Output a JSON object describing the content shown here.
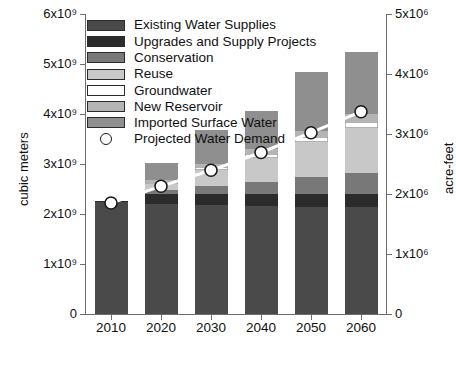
{
  "chart_data": {
    "type": "bar",
    "subtype": "stacked-bar-with-line",
    "title": "",
    "xlabel": "",
    "ylabel": "cubic meters",
    "y2label": "acre-feet",
    "categories": [
      "2010",
      "2020",
      "2030",
      "2040",
      "2050",
      "2060"
    ],
    "ylim": [
      0,
      6000000000
    ],
    "y2lim": [
      0,
      5000000
    ],
    "yticks": [
      "0",
      "1x10⁹",
      "2x10⁹",
      "3x10⁹",
      "4x10⁹",
      "5x10⁹",
      "6x10⁹"
    ],
    "ytick_values": [
      0,
      1000000000,
      2000000000,
      3000000000,
      4000000000,
      5000000000,
      6000000000
    ],
    "y2ticks": [
      "0",
      "1x10⁶",
      "2x10⁶",
      "3x10⁶",
      "4x10⁶",
      "5x10⁶"
    ],
    "y2tick_values": [
      0,
      1000000,
      2000000,
      3000000,
      4000000,
      5000000
    ],
    "grid": false,
    "legend_position": "upper-left",
    "series": [
      {
        "name": "Existing Water Supplies",
        "color": "#4a4a4a",
        "values": [
          2250000000,
          2200000000,
          2180000000,
          2160000000,
          2150000000,
          2140000000
        ]
      },
      {
        "name": "Upgrades and Supply Projects",
        "color": "#2b2b2b",
        "values": [
          20000000,
          200000000,
          230000000,
          250000000,
          260000000,
          270000000
        ]
      },
      {
        "name": "Conservation",
        "color": "#787878",
        "values": [
          0,
          80000000,
          160000000,
          240000000,
          330000000,
          420000000
        ]
      },
      {
        "name": "Reuse",
        "color": "#c8c8c8",
        "values": [
          0,
          130000000,
          310000000,
          470000000,
          700000000,
          900000000
        ]
      },
      {
        "name": "Groundwater",
        "color": "#fdfdfd",
        "values": [
          0,
          40000000,
          70000000,
          90000000,
          110000000,
          120000000
        ]
      },
      {
        "name": "New Reservoir",
        "color": "#b4b4b4",
        "values": [
          0,
          30000000,
          60000000,
          90000000,
          120000000,
          150000000
        ]
      },
      {
        "name": "Imported Surface Water",
        "color": "#8f8f8f",
        "values": [
          0,
          350000000,
          680000000,
          760000000,
          1180000000,
          1250000000
        ]
      }
    ],
    "line_series": {
      "name": "Projected Water Demand",
      "marker": "circle",
      "marker_face_color": "#ffffff",
      "marker_edge_color": "#1a1a1a",
      "line_color": "#ffffff",
      "unit": "acre-feet",
      "values_acre_feet": [
        1800000,
        2070000,
        2330000,
        2620000,
        2940000,
        3280000
      ],
      "values_cubic_meters": [
        2220000000,
        2553000000,
        2874000000,
        3231000000,
        3626000000,
        4045000000
      ]
    }
  },
  "legend": {
    "items": [
      {
        "label": "Existing Water Supplies",
        "swatch": "#4a4a4a",
        "type": "box"
      },
      {
        "label": "Upgrades and Supply Projects",
        "swatch": "#2b2b2b",
        "type": "box"
      },
      {
        "label": "Conservation",
        "swatch": "#787878",
        "type": "box"
      },
      {
        "label": "Reuse",
        "swatch": "#c8c8c8",
        "type": "box"
      },
      {
        "label": "Groundwater",
        "swatch": "#fdfdfd",
        "type": "box"
      },
      {
        "label": "New Reservoir",
        "swatch": "#b4b4b4",
        "type": "box"
      },
      {
        "label": "Imported Surface Water",
        "swatch": "#8f8f8f",
        "type": "box"
      },
      {
        "label": "Projected Water Demand",
        "swatch": "#ffffff",
        "type": "circle"
      }
    ]
  },
  "axes": {
    "left_title": "cubic meters",
    "right_title": "acre-feet"
  },
  "colors": {
    "axis": "#6d6d6d",
    "text": "#111111",
    "background": "#ffffff"
  }
}
